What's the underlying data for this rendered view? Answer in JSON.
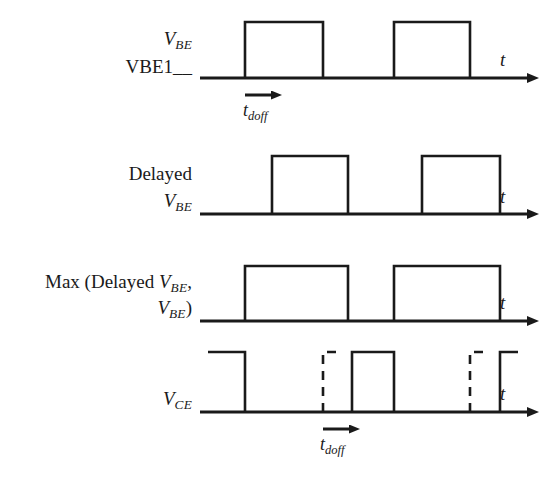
{
  "figure": {
    "background_color": "#ffffff",
    "line_color": "#1a1a1a",
    "axis_time_label": "t"
  },
  "waveforms": [
    {
      "id": "vbe",
      "label_lines": [
        "V_BE",
        "VBE1__"
      ],
      "label_line1_base": "V",
      "label_line1_sub": "BE",
      "label_line2": "VBE1__",
      "axis_label": "t",
      "pulses": [
        {
          "start": 245,
          "end": 323
        },
        {
          "start": 394,
          "end": 470
        }
      ],
      "annotation": {
        "name": "t_doff",
        "base": "t",
        "sub": "doff",
        "arrow_from": 245,
        "arrow_to": 278
      }
    },
    {
      "id": "delayed-vbe",
      "label_lines": [
        "Delayed",
        "V_BE"
      ],
      "label_line1": "Delayed",
      "label_line2_base": "V",
      "label_line2_sub": "BE",
      "axis_label": "t",
      "pulses": [
        {
          "start": 272,
          "end": 348
        },
        {
          "start": 422,
          "end": 500
        }
      ]
    },
    {
      "id": "max-delayed-vbe",
      "label_lines": [
        "Max (Delayed V_BE,",
        "V_BE)"
      ],
      "label_line1_prefix": "Max (Delayed ",
      "label_line1_base": "V",
      "label_line1_sub": "BE",
      "label_line1_suffix": ",",
      "label_line2_base": "V",
      "label_line2_sub": "BE",
      "label_line2_suffix": ")",
      "axis_label": "t",
      "pulses": [
        {
          "start": 245,
          "end": 348
        },
        {
          "start": 394,
          "end": 500
        }
      ]
    },
    {
      "id": "vce",
      "label_lines": [
        "V_CE"
      ],
      "label_base": "V",
      "label_sub": "CE",
      "axis_label": "t",
      "annotation": {
        "name": "t_doff",
        "base": "t",
        "sub": "doff",
        "arrow_from": 323,
        "arrow_to": 352
      }
    }
  ]
}
